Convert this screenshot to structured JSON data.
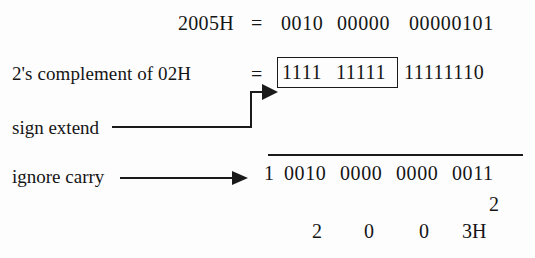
{
  "diagram": {
    "ink_color": "#1a1a1a",
    "background_color": "#fdfdfd"
  },
  "row1": {
    "label": "2005H",
    "equals": "=",
    "group1": "0010",
    "group2": "00000",
    "group3": "00000101"
  },
  "row2": {
    "label": "2's complement of 02H",
    "equals": "=",
    "boxed_group1": "1111",
    "boxed_group2": "11111",
    "outside_group": "11111110"
  },
  "annotations": {
    "sign_extend": "sign extend",
    "ignore_carry": "ignore carry"
  },
  "result": {
    "carry_bit": "1",
    "group1": "0010",
    "group2": "0000",
    "group3": "0000",
    "group4": "0011"
  },
  "hex_result": {
    "stray_digit": "2",
    "digit1": "2",
    "digit2": "0",
    "digit3": "0",
    "digit4": "3H"
  }
}
